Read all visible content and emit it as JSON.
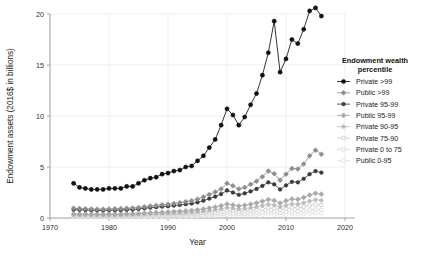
{
  "chart_data": {
    "type": "line",
    "title": "",
    "xlabel": "Year",
    "ylabel": "Endowment assets (2016$ in billions)",
    "xlim": [
      1970,
      2020
    ],
    "ylim": [
      0,
      20
    ],
    "xticks": [
      1970,
      1980,
      1990,
      2000,
      2010,
      2020
    ],
    "yticks": [
      0,
      5,
      10,
      15,
      20
    ],
    "grid": true,
    "legend_position": "right",
    "legend_title": "Endowment wealth percentile",
    "x": [
      1974,
      1975,
      1976,
      1977,
      1978,
      1979,
      1980,
      1981,
      1982,
      1983,
      1984,
      1985,
      1986,
      1987,
      1988,
      1989,
      1990,
      1991,
      1992,
      1993,
      1994,
      1995,
      1996,
      1997,
      1998,
      1999,
      2000,
      2001,
      2002,
      2003,
      2004,
      2005,
      2006,
      2007,
      2008,
      2009,
      2010,
      2011,
      2012,
      2013,
      2014,
      2015,
      2016
    ],
    "series": [
      {
        "name": "Private >99",
        "color": "#111111",
        "marker": "filled-circle",
        "values": [
          3.4,
          3.0,
          2.9,
          2.8,
          2.8,
          2.8,
          2.9,
          2.9,
          2.9,
          3.1,
          3.1,
          3.4,
          3.7,
          3.9,
          4.0,
          4.3,
          4.4,
          4.6,
          4.7,
          5.0,
          5.1,
          5.6,
          6.1,
          6.9,
          7.7,
          9.1,
          10.7,
          10.1,
          9.1,
          9.9,
          11.1,
          12.2,
          14.0,
          16.2,
          19.3,
          14.3,
          15.6,
          17.5,
          17.1,
          18.5,
          20.3,
          20.6,
          19.8
        ]
      },
      {
        "name": "Public >99",
        "color": "#8e8e8e",
        "marker": "filled-diamond",
        "values": [
          0.95,
          0.92,
          0.9,
          0.88,
          0.87,
          0.87,
          0.88,
          0.9,
          0.92,
          0.95,
          0.98,
          1.02,
          1.1,
          1.18,
          1.22,
          1.3,
          1.35,
          1.42,
          1.5,
          1.6,
          1.7,
          1.85,
          2.05,
          2.3,
          2.55,
          2.85,
          3.4,
          3.15,
          2.85,
          3.0,
          3.3,
          3.6,
          4.05,
          4.6,
          4.35,
          3.7,
          4.3,
          4.85,
          4.8,
          5.3,
          6.1,
          6.65,
          6.25
        ]
      },
      {
        "name": "Private 95-99",
        "color": "#3a3a3a",
        "marker": "filled-circle-small",
        "values": [
          0.82,
          0.8,
          0.78,
          0.76,
          0.75,
          0.75,
          0.76,
          0.77,
          0.78,
          0.8,
          0.83,
          0.88,
          0.95,
          1.02,
          1.06,
          1.12,
          1.16,
          1.22,
          1.28,
          1.35,
          1.42,
          1.54,
          1.7,
          1.9,
          2.1,
          2.35,
          2.7,
          2.5,
          2.28,
          2.42,
          2.62,
          2.85,
          3.15,
          3.5,
          3.3,
          2.8,
          3.2,
          3.55,
          3.5,
          3.85,
          4.3,
          4.6,
          4.45
        ]
      },
      {
        "name": "Public 95-99",
        "color": "#a8a8a8",
        "marker": "open-diamond-filled",
        "values": [
          0.4,
          0.39,
          0.38,
          0.37,
          0.37,
          0.37,
          0.38,
          0.38,
          0.39,
          0.41,
          0.42,
          0.45,
          0.48,
          0.52,
          0.54,
          0.57,
          0.6,
          0.63,
          0.66,
          0.7,
          0.74,
          0.8,
          0.88,
          0.98,
          1.08,
          1.2,
          1.38,
          1.28,
          1.18,
          1.25,
          1.36,
          1.48,
          1.64,
          1.82,
          1.72,
          1.46,
          1.68,
          1.86,
          1.84,
          2.02,
          2.26,
          2.42,
          2.34
        ]
      },
      {
        "name": "Private 90-95",
        "color": "#bcbcbc",
        "marker": "filled-circle-small",
        "values": [
          0.3,
          0.29,
          0.285,
          0.28,
          0.28,
          0.28,
          0.285,
          0.29,
          0.295,
          0.31,
          0.32,
          0.34,
          0.36,
          0.39,
          0.41,
          0.43,
          0.45,
          0.47,
          0.49,
          0.52,
          0.55,
          0.59,
          0.65,
          0.72,
          0.8,
          0.89,
          1.02,
          0.95,
          0.87,
          0.92,
          1.0,
          1.09,
          1.21,
          1.34,
          1.27,
          1.08,
          1.24,
          1.37,
          1.36,
          1.49,
          1.67,
          1.79,
          1.73
        ]
      },
      {
        "name": "Private 75-90",
        "color": "#c9c9c9",
        "marker": "open-circle",
        "values": [
          0.22,
          0.215,
          0.21,
          0.208,
          0.207,
          0.207,
          0.21,
          0.213,
          0.218,
          0.228,
          0.236,
          0.25,
          0.266,
          0.287,
          0.3,
          0.317,
          0.33,
          0.346,
          0.36,
          0.383,
          0.405,
          0.435,
          0.48,
          0.53,
          0.59,
          0.655,
          0.75,
          0.7,
          0.64,
          0.678,
          0.736,
          0.803,
          0.891,
          0.987,
          0.935,
          0.795,
          0.913,
          1.009,
          1.001,
          1.097,
          1.23,
          1.318,
          1.274
        ]
      },
      {
        "name": "Private 0 to 75",
        "color": "#d5d5d5",
        "marker": "open-circle",
        "values": [
          0.14,
          0.138,
          0.135,
          0.133,
          0.132,
          0.132,
          0.134,
          0.136,
          0.139,
          0.145,
          0.15,
          0.159,
          0.169,
          0.183,
          0.191,
          0.202,
          0.21,
          0.22,
          0.229,
          0.244,
          0.258,
          0.277,
          0.306,
          0.338,
          0.376,
          0.417,
          0.478,
          0.446,
          0.408,
          0.432,
          0.469,
          0.512,
          0.568,
          0.629,
          0.596,
          0.507,
          0.582,
          0.643,
          0.638,
          0.699,
          0.784,
          0.84,
          0.812
        ]
      },
      {
        "name": "Public 0-95",
        "color": "#e0e0e0",
        "marker": "open-circle",
        "values": [
          0.08,
          0.079,
          0.077,
          0.076,
          0.076,
          0.076,
          0.077,
          0.078,
          0.08,
          0.083,
          0.086,
          0.091,
          0.097,
          0.105,
          0.109,
          0.116,
          0.12,
          0.126,
          0.131,
          0.14,
          0.148,
          0.159,
          0.175,
          0.194,
          0.215,
          0.239,
          0.274,
          0.255,
          0.234,
          0.248,
          0.269,
          0.293,
          0.325,
          0.36,
          0.341,
          0.29,
          0.333,
          0.368,
          0.365,
          0.4,
          0.449,
          0.481,
          0.465
        ]
      }
    ]
  },
  "axes": {
    "y_title": "Endowment assets (2016$ in billions)",
    "x_title": "Year",
    "y_tick_labels": [
      "0",
      "5",
      "10",
      "15",
      "20"
    ],
    "x_tick_labels": [
      "1970",
      "1980",
      "1990",
      "2000",
      "2010",
      "2020"
    ]
  },
  "legend": {
    "title_line1": "Endowment wealth",
    "title_line2": "percentile",
    "items": [
      {
        "label": "Private >99"
      },
      {
        "label": "Public >99"
      },
      {
        "label": "Private 95-99"
      },
      {
        "label": "Public 95-99"
      },
      {
        "label": "Private 90-95"
      },
      {
        "label": "Private 75-90"
      },
      {
        "label": "Private 0 to 75"
      },
      {
        "label": "Public 0-95"
      }
    ]
  }
}
